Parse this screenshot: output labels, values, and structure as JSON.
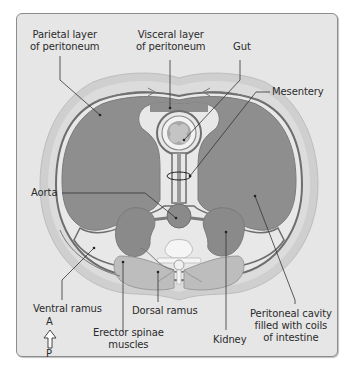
{
  "diagram": {
    "title": "",
    "colors": {
      "panel_bg": "#e6e6e6",
      "panel_border": "#8c8c8c",
      "body_wall": "#cfcfcf",
      "cavity_fill": "#8e8e8e",
      "peritoneum_line": "#6e6e6e",
      "organ_fill": "#8a8a8a",
      "light_fill": "#ededed",
      "leader_line": "#333333"
    },
    "labels": {
      "parietal": [
        "Parietal layer",
        "of peritoneum"
      ],
      "visceral": [
        "Visceral layer",
        "of peritoneum"
      ],
      "gut": "Gut",
      "mesentery": "Mesentery",
      "aorta": "Aorta",
      "ventral_ramus": "Ventral ramus",
      "dorsal_ramus": "Dorsal ramus",
      "erector": [
        "Erector spinae",
        "muscles"
      ],
      "kidney": "Kidney",
      "peritoneal_cavity": [
        "Peritoneal cavity",
        "filled with coils",
        "of intestine"
      ]
    },
    "orientation": {
      "top": "A",
      "bottom": "P",
      "arrow_icon": "up-arrow-outline"
    }
  }
}
